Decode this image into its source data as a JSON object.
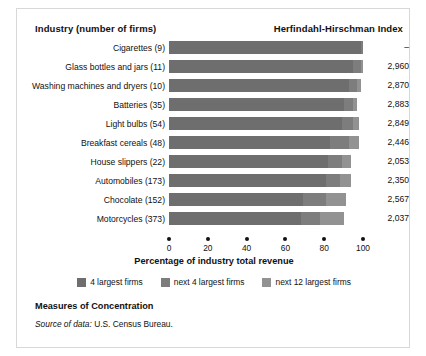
{
  "header": {
    "industry_label": "Industry (number of firms)",
    "hhi_label": "Herfindahl-Hirschman Index"
  },
  "axis": {
    "title": "Percentage of industry total revenue",
    "ticks": [
      "0",
      "20",
      "40",
      "60",
      "80",
      "100"
    ]
  },
  "legend": {
    "items": [
      {
        "label": "4 largest firms",
        "color": "#6e6e6e"
      },
      {
        "label": "next 4 largest firms",
        "color": "#7d7d7d"
      },
      {
        "label": "next 12 largest firms",
        "color": "#929292"
      }
    ]
  },
  "footer": {
    "title": "Measures of Concentration",
    "source_prefix": "Source of data:",
    "source_value": "U.S. Census Bureau."
  },
  "rows": [
    {
      "label": "Cigarettes  (9)",
      "hhi": "–"
    },
    {
      "label": "Glass bottles and jars  (11)",
      "hhi": "2,960"
    },
    {
      "label": "Washing machines and dryers  (10)",
      "hhi": "2,870"
    },
    {
      "label": "Batteries  (35)",
      "hhi": "2,883"
    },
    {
      "label": "Light bulbs  (54)",
      "hhi": "2,849"
    },
    {
      "label": "Breakfast cereals  (48)",
      "hhi": "2,446"
    },
    {
      "label": "House slippers  (22)",
      "hhi": "2,053"
    },
    {
      "label": "Automobiles  (173)",
      "hhi": "2,350"
    },
    {
      "label": "Chocolate  (152)",
      "hhi": "2,567"
    },
    {
      "label": "Motorcycles  (373)",
      "hhi": "2,037"
    }
  ],
  "chart_data": {
    "type": "bar",
    "orientation": "horizontal",
    "stacked": true,
    "title": "Measures of Concentration",
    "xlabel": "Percentage of industry total revenue",
    "ylabel": "Industry (number of firms)",
    "xlim": [
      0,
      100
    ],
    "xticks": [
      0,
      20,
      40,
      60,
      80,
      100
    ],
    "grid": false,
    "legend_position": "bottom",
    "categories": [
      "Cigarettes (9)",
      "Glass bottles and jars (11)",
      "Washing machines and dryers (10)",
      "Batteries (35)",
      "Light bulbs (54)",
      "Breakfast cereals (48)",
      "House slippers (22)",
      "Automobiles (173)",
      "Chocolate (152)",
      "Motorcycles (373)"
    ],
    "series": [
      {
        "name": "4 largest firms",
        "color": "#6e6e6e",
        "values": [
          99,
          95,
          93,
          90,
          89,
          83,
          82,
          81,
          69,
          68
        ]
      },
      {
        "name": "next 4 largest firms",
        "color": "#7d7d7d",
        "values": [
          1,
          4,
          4,
          5,
          6,
          10,
          7,
          7,
          12,
          10
        ]
      },
      {
        "name": "next 12 largest firms",
        "color": "#929292",
        "values": [
          0,
          1,
          2,
          2,
          3,
          5,
          5,
          6,
          10,
          12
        ]
      }
    ],
    "secondary_axis": {
      "name": "Herfindahl-Hirschman Index",
      "values": [
        "–",
        "2,960",
        "2,870",
        "2,883",
        "2,849",
        "2,446",
        "2,053",
        "2,350",
        "2,567",
        "2,037"
      ]
    },
    "source": "Source of data: U.S. Census Bureau."
  }
}
